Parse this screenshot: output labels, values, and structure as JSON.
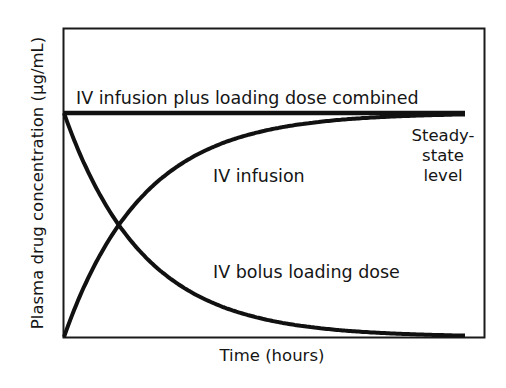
{
  "chart_data": {
    "type": "line",
    "title": "",
    "xlabel": "Time (hours)",
    "ylabel": "Plasma drug concentration (μg/mL)",
    "grid": false,
    "legend": "none (direct curve labels)",
    "xlim": [
      0,
      10
    ],
    "ylim": [
      0,
      1.38
    ],
    "x_ticks": [],
    "y_ticks": [],
    "steady_state_level": 1.0,
    "x": [
      0,
      0.5,
      1,
      1.5,
      2,
      2.5,
      3,
      3.5,
      4,
      4.5,
      5,
      5.5,
      6,
      6.5,
      7,
      7.5,
      8,
      8.5,
      9,
      9.5,
      10
    ],
    "series": [
      {
        "name": "IV infusion plus loading dose combined",
        "values": [
          1,
          1,
          1,
          1,
          1,
          1,
          1,
          1,
          1,
          1,
          1,
          1,
          1,
          1,
          1,
          1,
          1,
          1,
          1,
          1,
          1
        ]
      },
      {
        "name": "IV infusion",
        "values": [
          0,
          0.224,
          0.398,
          0.533,
          0.637,
          0.718,
          0.782,
          0.831,
          0.868,
          0.898,
          0.921,
          0.938,
          0.952,
          0.963,
          0.971,
          0.978,
          0.983,
          0.987,
          0.99,
          0.992,
          0.994
        ]
      },
      {
        "name": "IV bolus loading dose",
        "values": [
          1,
          0.776,
          0.602,
          0.467,
          0.363,
          0.282,
          0.218,
          0.169,
          0.132,
          0.102,
          0.079,
          0.062,
          0.048,
          0.037,
          0.029,
          0.022,
          0.017,
          0.013,
          0.01,
          0.008,
          0.006
        ]
      }
    ],
    "annotations": [
      {
        "text": "IV infusion plus loading dose combined",
        "near": "combined line"
      },
      {
        "text": "IV infusion",
        "near": "rising curve"
      },
      {
        "text": "IV bolus loading dose",
        "near": "decaying curve"
      },
      {
        "text": "Steady-state level",
        "near": "right end of combined line"
      }
    ]
  },
  "labels": {
    "combined": "IV infusion plus loading dose combined",
    "infusion": "IV infusion",
    "bolus": "IV bolus loading dose",
    "steady_1": "Steady-",
    "steady_2": "state",
    "steady_3": "level",
    "xlabel": "Time (hours)",
    "ylabel": "Plasma drug concentration (μg/mL)"
  },
  "colors": {
    "line": "#111111",
    "frame": "#1a1a1a",
    "background": "#ffffff"
  }
}
